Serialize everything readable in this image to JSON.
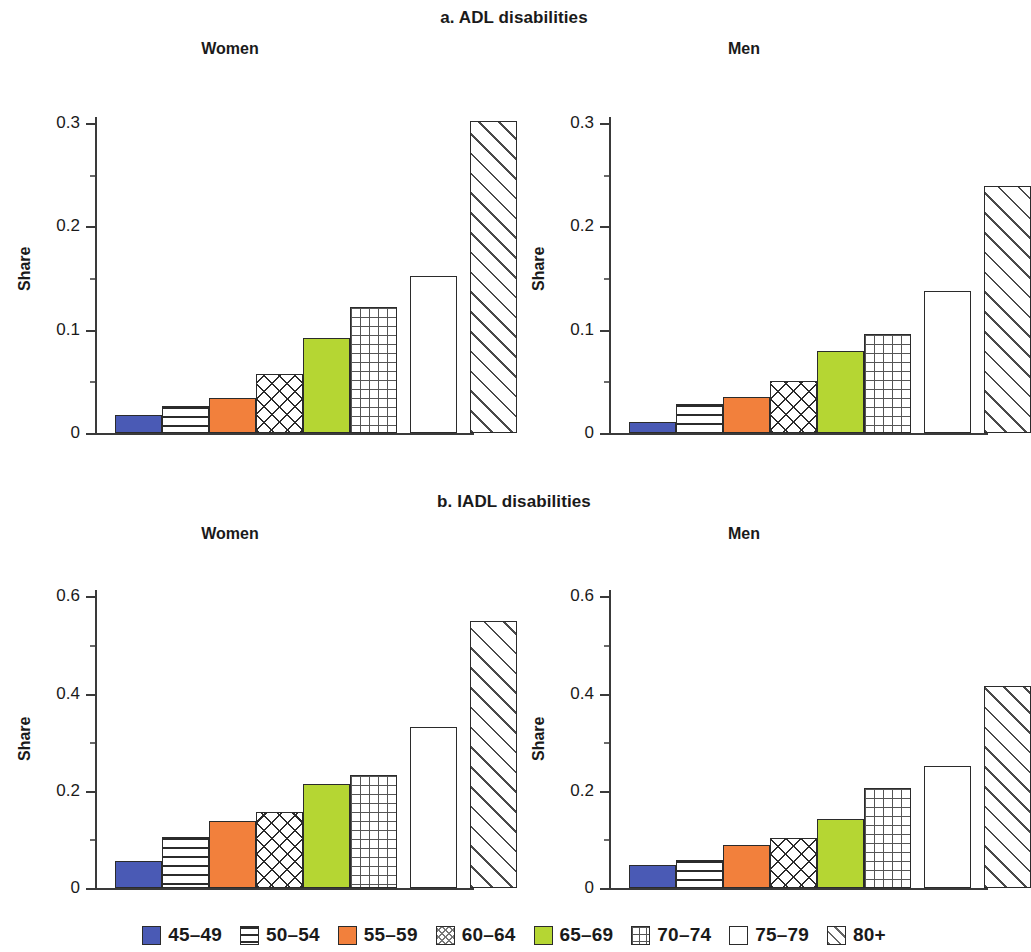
{
  "figure": {
    "panels": [
      {
        "id": "a",
        "title": "a. ADL disabilities"
      },
      {
        "id": "b",
        "title": "b. IADL disabilities"
      }
    ],
    "subplot_titles": {
      "women": "Women",
      "men": "Men"
    },
    "y_axis_label": "Share"
  },
  "legend": {
    "items": [
      {
        "label": "45–49",
        "pattern": "solid",
        "color": "#4a5ab5"
      },
      {
        "label": "50–54",
        "pattern": "hlines",
        "color": "#ffffff"
      },
      {
        "label": "55–59",
        "pattern": "solid",
        "color": "#f2803c"
      },
      {
        "label": "60–64",
        "pattern": "cross",
        "color": "#ffffff"
      },
      {
        "label": "65–69",
        "pattern": "solid",
        "color": "#b5d633"
      },
      {
        "label": "70–74",
        "pattern": "grid",
        "color": "#ffffff"
      },
      {
        "label": "75–79",
        "pattern": "empty",
        "color": "#ffffff"
      },
      {
        "label": "80+",
        "pattern": "diag",
        "color": "#ffffff"
      }
    ]
  },
  "chart_data": [
    {
      "type": "bar",
      "title": "a. ADL disabilities — Women",
      "panel": "a",
      "sex": "Women",
      "xlabel": "",
      "ylabel": "Share",
      "categories": [
        "45–49",
        "50–54",
        "55–59",
        "60–64",
        "65–69",
        "70–74",
        "75–79",
        "80+"
      ],
      "values": [
        0.017,
        0.026,
        0.034,
        0.057,
        0.092,
        0.122,
        0.152,
        0.302
      ],
      "ylim": [
        0,
        0.33
      ],
      "yticks": [
        0,
        0.1,
        0.2,
        0.3
      ],
      "ytick_labels": [
        "0",
        "0.1",
        "0.2",
        "0.3"
      ],
      "grid": false,
      "legend_position": "bottom"
    },
    {
      "type": "bar",
      "title": "a. ADL disabilities — Men",
      "panel": "a",
      "sex": "Men",
      "xlabel": "",
      "ylabel": "Share",
      "categories": [
        "45–49",
        "50–54",
        "55–59",
        "60–64",
        "65–69",
        "70–74",
        "75–79",
        "80+"
      ],
      "values": [
        0.011,
        0.028,
        0.035,
        0.05,
        0.079,
        0.096,
        0.137,
        0.239
      ],
      "ylim": [
        0,
        0.33
      ],
      "yticks": [
        0,
        0.1,
        0.2,
        0.3
      ],
      "ytick_labels": [
        "0",
        "0.1",
        "0.2",
        "0.3"
      ],
      "grid": false,
      "legend_position": "bottom"
    },
    {
      "type": "bar",
      "title": "b. IADL disabilities — Women",
      "panel": "b",
      "sex": "Women",
      "xlabel": "",
      "ylabel": "Share",
      "categories": [
        "45–49",
        "50–54",
        "55–59",
        "60–64",
        "65–69",
        "70–74",
        "75–79",
        "80+"
      ],
      "values": [
        0.055,
        0.105,
        0.137,
        0.157,
        0.215,
        0.233,
        0.331,
        0.55
      ],
      "ylim": [
        0,
        0.64
      ],
      "yticks": [
        0,
        0.2,
        0.4,
        0.6
      ],
      "ytick_labels": [
        "0",
        "0.2",
        "0.4",
        "0.6"
      ],
      "grid": false,
      "legend_position": "bottom"
    },
    {
      "type": "bar",
      "title": "b. IADL disabilities — Men",
      "panel": "b",
      "sex": "Men",
      "xlabel": "",
      "ylabel": "Share",
      "categories": [
        "45–49",
        "50–54",
        "55–59",
        "60–64",
        "65–69",
        "70–74",
        "75–79",
        "80+"
      ],
      "values": [
        0.047,
        0.057,
        0.088,
        0.103,
        0.142,
        0.205,
        0.251,
        0.415
      ],
      "ylim": [
        0,
        0.64
      ],
      "yticks": [
        0,
        0.2,
        0.4,
        0.6
      ],
      "ytick_labels": [
        "0",
        "0.2",
        "0.4",
        "0.6"
      ],
      "grid": false,
      "legend_position": "bottom"
    }
  ]
}
